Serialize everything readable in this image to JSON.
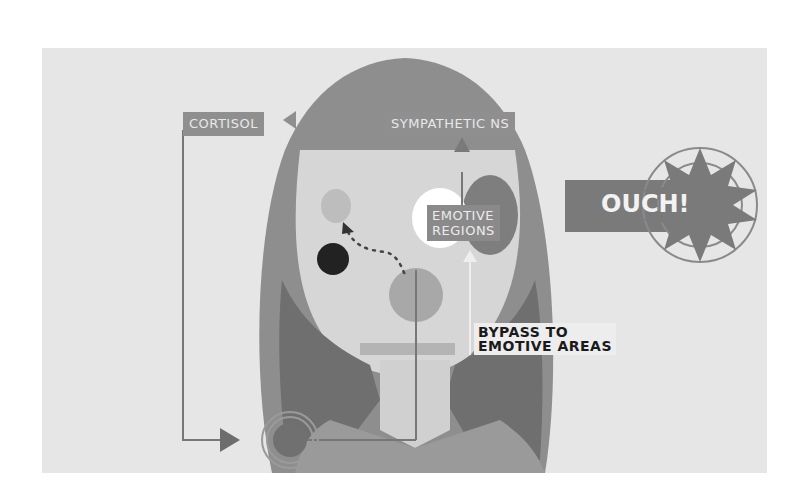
{
  "diagram": {
    "labels": {
      "cortisol": "CORTISOL",
      "sympathetic_ns": "SYMPATHETIC NS",
      "emotive_regions_line1": "EMOTIVE",
      "emotive_regions_line2": "REGIONS",
      "ouch": "OUCH!",
      "bypass_line1": "BYPASS TO",
      "bypass_line2": "EMOTIVE AREAS"
    },
    "colors": {
      "background": "#ffffff",
      "panel": "#e6e6e6",
      "hair": "#8e8e8e",
      "hair_dark": "#7a7a7a",
      "face": "#d6d6d6",
      "label_fill": "#8f8f8f",
      "dark_dot": "#222222",
      "highlight": "#ffffff"
    }
  }
}
